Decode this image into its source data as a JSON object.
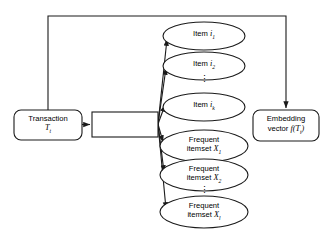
{
  "diagram": {
    "stroke_color": "#1a1a1a",
    "fill_color": "#ffffff",
    "background": "#ffffff",
    "nodes": {
      "transaction": {
        "shape": "rounded-rect",
        "line1": "Transaction",
        "line2_math": "T",
        "line2_sub": "t",
        "x": 14,
        "y": 110,
        "w": 68,
        "h": 30
      },
      "hidden": {
        "shape": "rect",
        "label": "",
        "x": 92,
        "y": 112,
        "w": 66,
        "h": 25
      },
      "embedding": {
        "shape": "rounded-rect",
        "line1": "Embedding",
        "line2_prefix": "vector ",
        "line2_math": "f",
        "line2_arg": "(T",
        "line2_sub": "t",
        "line2_suffix": ")",
        "x": 253,
        "y": 110,
        "w": 66,
        "h": 31
      },
      "item_1": {
        "shape": "ellipse",
        "prefix": "Item ",
        "math": "i",
        "sub": "1",
        "cx": 204,
        "cy": 36,
        "rx": 41,
        "ry": 14
      },
      "item_2": {
        "shape": "ellipse",
        "prefix": "Item ",
        "math": "i",
        "sub": "2",
        "cx": 204,
        "cy": 66,
        "rx": 41,
        "ry": 14
      },
      "item_k": {
        "shape": "ellipse",
        "prefix": "Item ",
        "math": "i",
        "sub": "k",
        "cx": 204,
        "cy": 107,
        "rx": 41,
        "ry": 14
      },
      "itemset_1": {
        "shape": "ellipse",
        "line1": "Frequent",
        "line2_prefix": "itemset ",
        "math": "X",
        "sub": "1",
        "cx": 204,
        "cy": 146,
        "rx": 44,
        "ry": 16
      },
      "itemset_2": {
        "shape": "ellipse",
        "line1": "Frequent",
        "line2_prefix": "itemset ",
        "math": "X",
        "sub": "2",
        "cx": 204,
        "cy": 175,
        "rx": 44,
        "ry": 16
      },
      "itemset_l": {
        "shape": "ellipse",
        "line1": "Frequent",
        "line2_prefix": "itemset ",
        "math": "X",
        "sub": "l",
        "cx": 204,
        "cy": 212,
        "rx": 44,
        "ry": 16
      }
    },
    "ellipsis": {
      "items_gap": {
        "glyph": "⋮",
        "x": 204,
        "y": 80
      },
      "itemsets_gap": {
        "glyph": "⋮",
        "x": 204,
        "y": 191
      }
    },
    "edges": [
      {
        "name": "transaction-to-hidden",
        "from": "transaction",
        "to": "hidden",
        "arrow": true
      },
      {
        "name": "hidden-to-item-1",
        "from": "hidden",
        "to": "item_1",
        "arrow": true
      },
      {
        "name": "hidden-to-item-2",
        "from": "hidden",
        "to": "item_2",
        "arrow": true
      },
      {
        "name": "hidden-to-item-k",
        "from": "hidden",
        "to": "item_k",
        "arrow": true
      },
      {
        "name": "hidden-to-itemset-1",
        "from": "hidden",
        "to": "itemset_1",
        "arrow": true
      },
      {
        "name": "hidden-to-itemset-2",
        "from": "hidden",
        "to": "itemset_2",
        "arrow": true
      },
      {
        "name": "hidden-to-itemset-l",
        "from": "hidden",
        "to": "itemset_l",
        "arrow": true
      },
      {
        "name": "transaction-to-embedding-bypass",
        "from": "transaction",
        "to": "embedding",
        "arrow": true,
        "routing": "top-orthogonal"
      }
    ]
  }
}
